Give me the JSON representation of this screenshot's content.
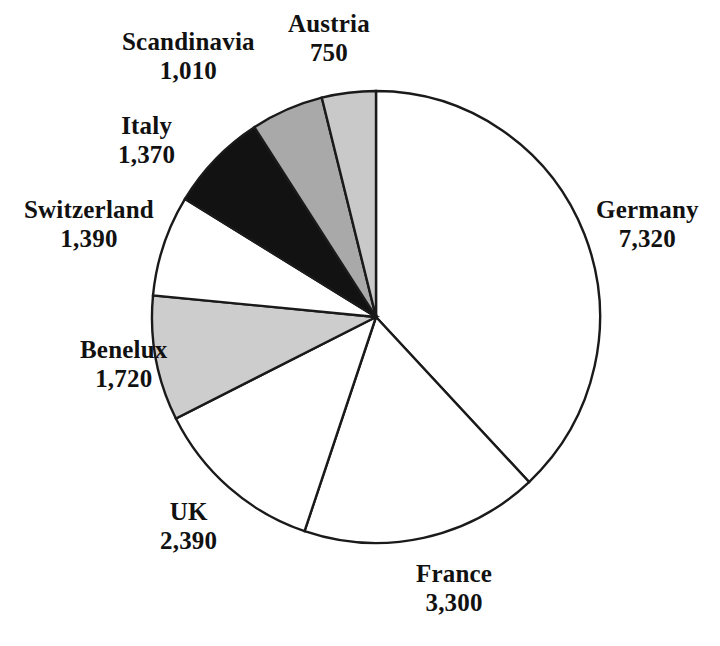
{
  "chart_data": {
    "type": "pie",
    "title": "",
    "subtitle": "",
    "xlabel": "",
    "ylabel": "",
    "legend_position": "none",
    "grid": false,
    "total": 19250,
    "start_angle_deg": 0,
    "direction": "clockwise",
    "categories": [
      "Germany",
      "France",
      "UK",
      "Benelux",
      "Switzerland",
      "Italy",
      "Scandinavia",
      "Austria"
    ],
    "values": [
      7320,
      3300,
      2390,
      1720,
      1390,
      1370,
      1010,
      750
    ],
    "value_labels": [
      "7,320",
      "3,300",
      "2,390",
      "1,720",
      "1,390",
      "1,370",
      "1,010",
      "750"
    ],
    "slices": [
      {
        "label": "Germany",
        "value": 7320,
        "value_label": "7,320",
        "fill": "#ffffff",
        "start_deg": 0,
        "sweep_deg": 136.9,
        "label_x": 596,
        "label_y": 196,
        "label_align": "left"
      },
      {
        "label": "France",
        "value": 3300,
        "value_label": "3,300",
        "fill": "#ffffff",
        "start_deg": 136.9,
        "sweep_deg": 61.7,
        "label_x": 416,
        "label_y": 560,
        "label_align": "left"
      },
      {
        "label": "UK",
        "value": 2390,
        "value_label": "2,390",
        "fill": "#ffffff",
        "start_deg": 198.6,
        "sweep_deg": 44.7,
        "label_x": 160,
        "label_y": 498,
        "label_align": "left"
      },
      {
        "label": "Benelux",
        "value": 1720,
        "value_label": "1,720",
        "fill": "#cdcdcd",
        "start_deg": 243.3,
        "sweep_deg": 32.2,
        "label_x": 80,
        "label_y": 336,
        "label_align": "left"
      },
      {
        "label": "Switzerland",
        "value": 1390,
        "value_label": "1,390",
        "fill": "#ffffff",
        "start_deg": 275.5,
        "sweep_deg": 26.0,
        "label_x": 24,
        "label_y": 196,
        "label_align": "left"
      },
      {
        "label": "Italy",
        "value": 1370,
        "value_label": "1,370",
        "fill": "#121212",
        "start_deg": 301.5,
        "sweep_deg": 25.6,
        "label_x": 118,
        "label_y": 112,
        "label_align": "left"
      },
      {
        "label": "Scandinavia",
        "value": 1010,
        "value_label": "1,010",
        "fill": "#a9a9a9",
        "start_deg": 327.1,
        "sweep_deg": 18.9,
        "label_x": 122,
        "label_y": 28,
        "label_align": "left"
      },
      {
        "label": "Austria",
        "value": 750,
        "value_label": "750",
        "fill": "#c9c9c9",
        "start_deg": 346.0,
        "sweep_deg": 14.0,
        "label_x": 288,
        "label_y": 10,
        "label_align": "left"
      }
    ],
    "geometry": {
      "center_x": 376,
      "center_y": 317,
      "radius_x": 224,
      "radius_y": 226
    },
    "colors": {
      "outline": "#1a1a1a",
      "text": "#111111",
      "background": "#ffffff",
      "fill_white": "#ffffff",
      "fill_light_gray": "#c9c9c9",
      "fill_medium_gray": "#a9a9a9",
      "fill_black": "#121212"
    }
  }
}
